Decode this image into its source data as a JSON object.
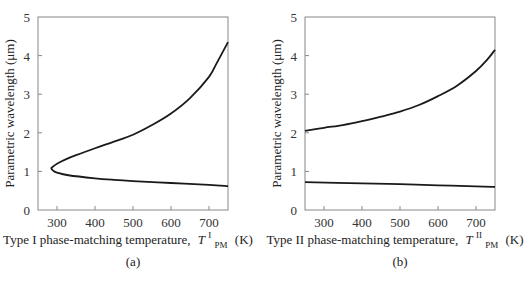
{
  "chart_data": [
    {
      "type": "line",
      "panel_label": "(a)",
      "title": "",
      "xlabel": "Type I phase-matching temperature,",
      "xlabel_symbol": "T",
      "xlabel_superscript": "I",
      "xlabel_subscript": "PM",
      "xlabel_unit": "(K)",
      "ylabel": "Parametric wavelength (μm)",
      "xlim": [
        250,
        750
      ],
      "ylim": [
        0,
        5
      ],
      "xticks": [
        300,
        400,
        500,
        600,
        700
      ],
      "yticks": [
        0,
        1,
        2,
        3,
        4,
        5
      ],
      "grid": false,
      "series": [
        {
          "name": "signal/idler (Type I)",
          "points": [
            [
              750,
              4.35
            ],
            [
              720,
              3.8
            ],
            [
              700,
              3.45
            ],
            [
              650,
              2.9
            ],
            [
              600,
              2.5
            ],
            [
              550,
              2.2
            ],
            [
              500,
              1.95
            ],
            [
              450,
              1.77
            ],
            [
              400,
              1.6
            ],
            [
              350,
              1.42
            ],
            [
              320,
              1.3
            ],
            [
              300,
              1.2
            ],
            [
              290,
              1.13
            ],
            [
              285,
              1.08
            ],
            [
              290,
              1.02
            ],
            [
              300,
              0.97
            ],
            [
              330,
              0.9
            ],
            [
              400,
              0.82
            ],
            [
              450,
              0.78
            ],
            [
              500,
              0.75
            ],
            [
              600,
              0.7
            ],
            [
              700,
              0.65
            ],
            [
              750,
              0.62
            ]
          ]
        }
      ]
    },
    {
      "type": "line",
      "panel_label": "(b)",
      "title": "",
      "xlabel": "Type II phase-matching temperature,",
      "xlabel_symbol": "T",
      "xlabel_superscript": "II",
      "xlabel_subscript": "PM",
      "xlabel_unit": "(K)",
      "ylabel": "Parametric wavelength (μm)",
      "xlim": [
        250,
        750
      ],
      "ylim": [
        0,
        5
      ],
      "xticks": [
        300,
        400,
        500,
        600,
        700
      ],
      "yticks": [
        0,
        1,
        2,
        3,
        4,
        5
      ],
      "grid": false,
      "series": [
        {
          "name": "idler (Type II)",
          "points": [
            [
              250,
              2.05
            ],
            [
              300,
              2.13
            ],
            [
              350,
              2.2
            ],
            [
              400,
              2.3
            ],
            [
              450,
              2.42
            ],
            [
              500,
              2.55
            ],
            [
              550,
              2.72
            ],
            [
              600,
              2.95
            ],
            [
              650,
              3.22
            ],
            [
              700,
              3.6
            ],
            [
              730,
              3.9
            ],
            [
              750,
              4.15
            ]
          ]
        },
        {
          "name": "signal (Type II)",
          "points": [
            [
              250,
              0.72
            ],
            [
              400,
              0.69
            ],
            [
              500,
              0.67
            ],
            [
              600,
              0.64
            ],
            [
              700,
              0.61
            ],
            [
              750,
              0.6
            ]
          ]
        }
      ]
    }
  ]
}
